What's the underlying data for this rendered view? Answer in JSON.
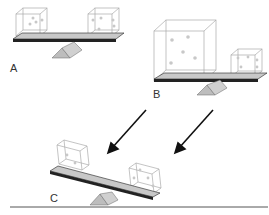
{
  "diagram": {
    "panels": [
      {
        "label": "A",
        "description": "Balanced seesaw with two equal small dice"
      },
      {
        "label": "B",
        "description": "Seesaw with large die on left and small die on right, balanced"
      },
      {
        "label": "C",
        "description": "Tilted seesaw with two small dice, left side raised"
      }
    ],
    "colors": {
      "beam": "#c8c8c8",
      "beam_edge": "#222222",
      "fulcrum": "#bdbdbd",
      "die_edge": "#aaaaaa",
      "pip": "#c8c8c8",
      "arrow": "#111111",
      "ground": "#555555"
    }
  }
}
